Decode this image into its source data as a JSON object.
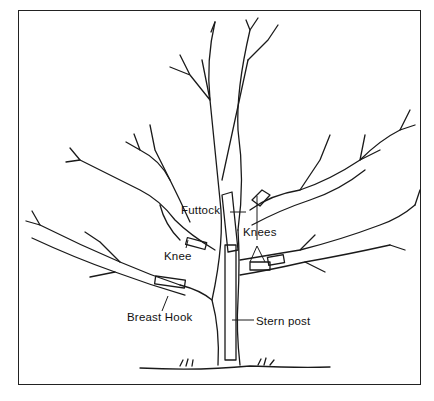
{
  "figure": {
    "labels": {
      "futtock": "Futtock",
      "knees": "Knees",
      "knee": "Knee",
      "breast_hook": "Breast Hook",
      "stern_post": "Stern post"
    }
  },
  "colors": {
    "ink": "#1a1a1a",
    "background": "#ffffff"
  }
}
